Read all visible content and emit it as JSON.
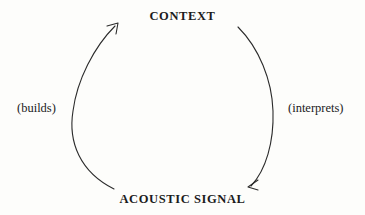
{
  "diagram": {
    "title_top": "CONTEXT",
    "title_bottom": "ACOUSTIC SIGNAL",
    "edge_left_label": "(builds)",
    "edge_right_label": "(interprets)",
    "stroke_color": "#2b2b2b",
    "text_color": "#1b1b1b",
    "background_color": "#fdfdfb",
    "nodes": [
      {
        "id": "context",
        "label": "CONTEXT"
      },
      {
        "id": "acoustic-signal",
        "label": "ACOUSTIC SIGNAL"
      }
    ],
    "edges": [
      {
        "id": "builds-arc",
        "label": "(builds)",
        "from": "acoustic-signal",
        "to": "context",
        "direction": "upward",
        "side": "left",
        "arrowhead": "open-v"
      },
      {
        "id": "interprets-arc",
        "label": "(interprets)",
        "from": "context",
        "to": "acoustic-signal",
        "direction": "downward",
        "side": "right",
        "arrowhead": "open-v"
      }
    ]
  }
}
